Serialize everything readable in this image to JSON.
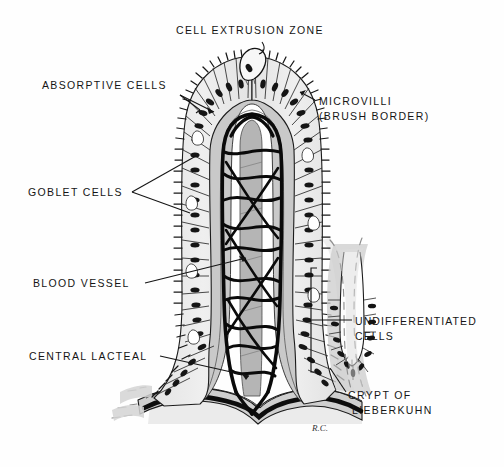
{
  "figure": {
    "title_top": "CELL EXTRUSION ZONE",
    "signature": "R.C.",
    "colors": {
      "ink": "#141414",
      "paper": "#fefefe",
      "lamina_propria_gray": "#c9c9c9",
      "epithelium_fill": "#ebebeb",
      "lacteal_gray": "#b9b9b9",
      "nucleus": "#1a1a1a",
      "shadow_gray": "#d8d8d8"
    },
    "labels": [
      {
        "id": "cell-extrusion-zone",
        "lines": [
          "CELL EXTRUSION ZONE"
        ],
        "x": 176,
        "y": 34,
        "anchor": "start"
      },
      {
        "id": "absorptive-cells",
        "lines": [
          "ABSORPTIVE CELLS"
        ],
        "x": 42,
        "y": 89,
        "anchor": "start"
      },
      {
        "id": "microvilli",
        "lines": [
          "MICROVILLI",
          "(BRUSH BORDER)"
        ],
        "x": 319,
        "y": 105,
        "anchor": "start"
      },
      {
        "id": "goblet-cells",
        "lines": [
          "GOBLET CELLS"
        ],
        "x": 28,
        "y": 196,
        "anchor": "start"
      },
      {
        "id": "blood-vessel",
        "lines": [
          "BLOOD VESSEL"
        ],
        "x": 33,
        "y": 287,
        "anchor": "start"
      },
      {
        "id": "central-lacteal",
        "lines": [
          "CENTRAL LACTEAL"
        ],
        "x": 29,
        "y": 360,
        "anchor": "start"
      },
      {
        "id": "undifferentiated-cells",
        "lines": [
          "UNDIFFERENTIATED",
          "CELLS"
        ],
        "x": 355,
        "y": 325,
        "anchor": "start"
      },
      {
        "id": "crypt-of-lieberkuhn",
        "lines": [
          "CRYPT OF",
          "LIEBERKUHN"
        ],
        "x": 348,
        "y": 399,
        "anchor": "start"
      }
    ]
  }
}
